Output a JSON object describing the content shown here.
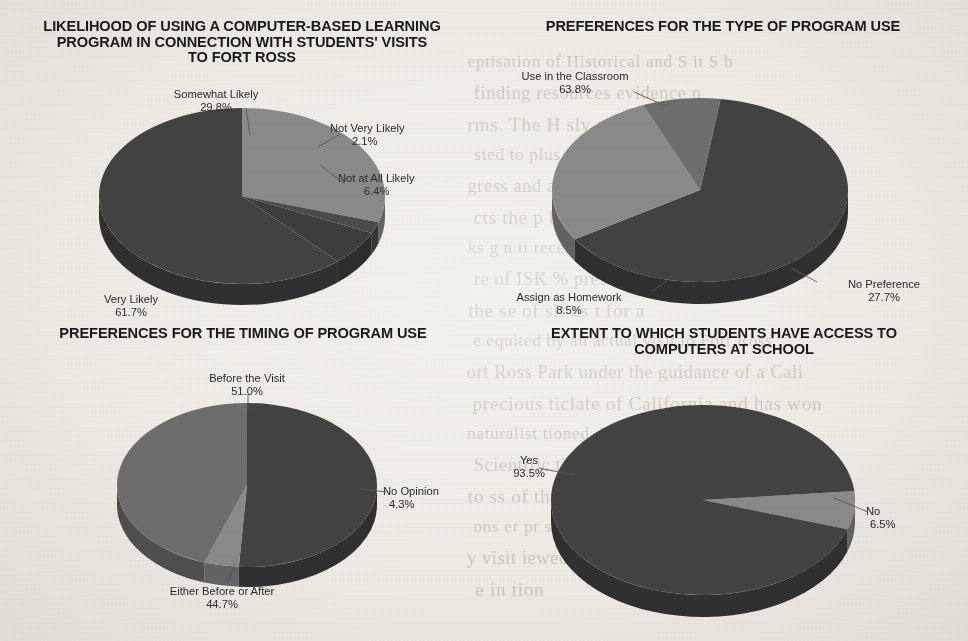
{
  "page": {
    "background_color": "#efece6",
    "slice_dark_color": "#434343",
    "slice_light_color": "#8a8a8a",
    "slice_mid_color": "#6e6e6e",
    "text_color": "#2b2b2b"
  },
  "charts": [
    {
      "id": "likelihood-of-use",
      "title": "LIKELIHOOD OF USING A COMPUTER-BASED LEARNING\nPROGRAM IN CONNECTION WITH STUDENTS' VISITS\nTO FORT ROSS",
      "labels": {
        "somewhat_likely": "Somewhat Likely",
        "somewhat_likely_value": "29.8%",
        "not_very_likely": "Not Very Likely",
        "not_very_likely_value": "2.1%",
        "not_at_all_likely": "Not at All Likely",
        "not_at_all_likely_value": "6.4%",
        "very_likely": "Very Likely",
        "very_likely_value": "61.7%"
      }
    },
    {
      "id": "type-of-program-use",
      "title": "PREFERENCES FOR THE TYPE OF PROGRAM USE",
      "labels": {
        "use_in_classroom": "Use in the Classroom",
        "use_in_classroom_value": "63.8%",
        "no_preference": "No Preference",
        "no_preference_value": "27.7%",
        "assign_as_homework": "Assign as Homework",
        "assign_as_homework_value": "8.5%"
      }
    },
    {
      "id": "timing-of-program-use",
      "title": "PREFERENCES FOR THE TIMING OF PROGRAM USE",
      "labels": {
        "before_the_visit": "Before the Visit",
        "before_the_visit_value": "51.0%",
        "no_opinion": "No Opinion",
        "no_opinion_value": "4.3%",
        "either_before_or_after": "Either Before or After",
        "either_before_or_after_value": "44.7%"
      }
    },
    {
      "id": "computer-access",
      "title": "EXTENT TO WHICH STUDENTS HAVE ACCESS TO\nCOMPUTERS AT SCHOOL",
      "labels": {
        "yes": "Yes",
        "yes_value": "93.5%",
        "no": "No",
        "no_value": "6.5%"
      }
    }
  ],
  "ghost_text": [
    "eptisation of Historical and S    it S b",
    "finding resources evidence p",
    "rms. The H  sly  significantl  on",
    "sted to         plus        eys clan to",
    "gress and       as H    and some mutual",
    "cts the p     ble  rosion  with  H to  a",
    "ks   g       n     ii   recent studial  a seper",
    "re of ISK     %  present al tort b",
    "the  se of    sif     as           t for      a",
    "e  equited by an actual visit to Fort Ross",
    "ort Ross  Park under the guidance of a Cali",
    "precious     ticlate of California    and has won",
    "naturalist             tioned. No       Fort Ross    Cultural",
    "Scientific      tian  is      cularly     d    rai",
    "to     ss   of the     ren    im    the    s    st   ed",
    "ons    er pr some  as expected   sically",
    "y visit   iewed from a per    a person   and  f",
    "e in   tion"
  ],
  "chart_data": [
    {
      "type": "pie",
      "title": "LIKELIHOOD OF USING A COMPUTER-BASED LEARNING PROGRAM IN CONNECTION WITH STUDENTS' VISITS TO FORT ROSS",
      "categories": [
        "Very Likely",
        "Somewhat Likely",
        "Not Very Likely",
        "Not at All Likely"
      ],
      "values": [
        61.7,
        29.8,
        2.1,
        6.4
      ],
      "unit": "%",
      "legend": "labels-with-callouts",
      "colors": [
        "#434343",
        "#8a8a8a",
        "#434343",
        "#434343"
      ]
    },
    {
      "type": "pie",
      "title": "PREFERENCES FOR THE TYPE OF PROGRAM USE",
      "categories": [
        "Use in the Classroom",
        "No Preference",
        "Assign as Homework"
      ],
      "values": [
        63.8,
        27.7,
        8.5
      ],
      "unit": "%",
      "legend": "labels-with-callouts",
      "colors": [
        "#434343",
        "#8a8a8a",
        "#6e6e6e"
      ]
    },
    {
      "type": "pie",
      "title": "PREFERENCES FOR THE TIMING OF PROGRAM USE",
      "categories": [
        "Before the Visit",
        "No Opinion",
        "Either Before or After"
      ],
      "values": [
        51.0,
        4.3,
        44.7
      ],
      "unit": "%",
      "legend": "labels-with-callouts",
      "colors": [
        "#434343",
        "#8a8a8a",
        "#6e6e6e"
      ]
    },
    {
      "type": "pie",
      "title": "EXTENT TO WHICH STUDENTS HAVE ACCESS TO COMPUTERS AT SCHOOL",
      "categories": [
        "Yes",
        "No"
      ],
      "values": [
        93.5,
        6.5
      ],
      "unit": "%",
      "legend": "labels-with-callouts",
      "colors": [
        "#434343",
        "#8a8a8a"
      ]
    }
  ]
}
